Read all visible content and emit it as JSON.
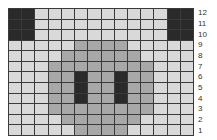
{
  "grid": {
    "columns": 14,
    "rows": 12,
    "colors": {
      "L": "#d9d9d9",
      "M": "#a8a8a8",
      "D": "#2a2a2a",
      "gridline": "#3a3a3a"
    },
    "row_labels": [
      "12",
      "11",
      "10",
      "9",
      "8",
      "7",
      "6",
      "5",
      "4",
      "3",
      "2",
      "1"
    ],
    "cells": [
      [
        "D",
        "D",
        "L",
        "L",
        "L",
        "L",
        "L",
        "L",
        "L",
        "L",
        "L",
        "L",
        "D",
        "D"
      ],
      [
        "D",
        "D",
        "L",
        "L",
        "L",
        "L",
        "L",
        "L",
        "L",
        "L",
        "L",
        "L",
        "D",
        "D"
      ],
      [
        "D",
        "D",
        "L",
        "L",
        "L",
        "L",
        "L",
        "L",
        "L",
        "L",
        "L",
        "L",
        "D",
        "D"
      ],
      [
        "L",
        "L",
        "L",
        "L",
        "L",
        "M",
        "M",
        "M",
        "M",
        "L",
        "L",
        "L",
        "L",
        "L"
      ],
      [
        "L",
        "L",
        "L",
        "L",
        "M",
        "M",
        "M",
        "M",
        "M",
        "M",
        "L",
        "L",
        "L",
        "L"
      ],
      [
        "L",
        "L",
        "L",
        "M",
        "M",
        "M",
        "M",
        "M",
        "M",
        "M",
        "M",
        "L",
        "L",
        "L"
      ],
      [
        "L",
        "L",
        "L",
        "M",
        "M",
        "D",
        "M",
        "M",
        "D",
        "M",
        "M",
        "L",
        "L",
        "L"
      ],
      [
        "L",
        "L",
        "L",
        "M",
        "M",
        "D",
        "M",
        "M",
        "D",
        "M",
        "M",
        "L",
        "L",
        "L"
      ],
      [
        "L",
        "L",
        "L",
        "M",
        "M",
        "D",
        "M",
        "M",
        "D",
        "M",
        "M",
        "L",
        "L",
        "L"
      ],
      [
        "L",
        "L",
        "L",
        "M",
        "M",
        "M",
        "M",
        "M",
        "M",
        "M",
        "M",
        "L",
        "L",
        "L"
      ],
      [
        "L",
        "L",
        "L",
        "L",
        "M",
        "M",
        "M",
        "M",
        "M",
        "M",
        "L",
        "L",
        "L",
        "L"
      ],
      [
        "L",
        "L",
        "L",
        "L",
        "L",
        "M",
        "M",
        "M",
        "M",
        "L",
        "L",
        "L",
        "L",
        "L"
      ]
    ]
  }
}
